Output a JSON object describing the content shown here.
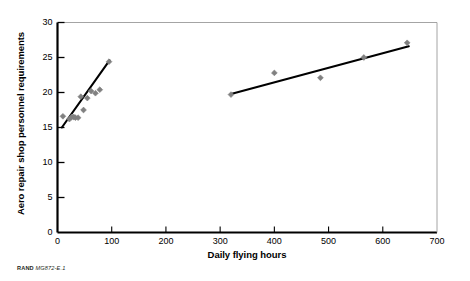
{
  "caption": {
    "organization": "RAND",
    "identifier": "MG872-E.1"
  },
  "chart_data": {
    "type": "scatter",
    "title": "",
    "subtitle": "",
    "xlabel": "Daily flying hours",
    "ylabel": "Aero repair shop personnel requirements",
    "xlim": [
      0,
      700
    ],
    "ylim": [
      0,
      30
    ],
    "xticks": [
      0,
      100,
      200,
      300,
      400,
      500,
      600,
      700
    ],
    "yticks": [
      0,
      5,
      10,
      15,
      20,
      25,
      30
    ],
    "grid": false,
    "legend": null,
    "marker_color": "#808080",
    "marker_shape": "diamond",
    "line_color": "#000000",
    "series": [
      {
        "name": "Low flying hours units",
        "points": [
          {
            "x": 10,
            "y": 16.6
          },
          {
            "x": 22,
            "y": 16.2
          },
          {
            "x": 26,
            "y": 16.5
          },
          {
            "x": 30,
            "y": 16.5
          },
          {
            "x": 33,
            "y": 16.4
          },
          {
            "x": 38,
            "y": 16.4
          },
          {
            "x": 43,
            "y": 19.4
          },
          {
            "x": 48,
            "y": 17.5
          },
          {
            "x": 55,
            "y": 19.2
          },
          {
            "x": 62,
            "y": 20.2
          },
          {
            "x": 70,
            "y": 19.9
          },
          {
            "x": 78,
            "y": 20.4
          },
          {
            "x": 95,
            "y": 24.4
          }
        ]
      },
      {
        "name": "High flying hours units",
        "points": [
          {
            "x": 320,
            "y": 19.7
          },
          {
            "x": 400,
            "y": 22.8
          },
          {
            "x": 485,
            "y": 22.1
          },
          {
            "x": 565,
            "y": 25.0
          },
          {
            "x": 645,
            "y": 27.1
          }
        ]
      }
    ],
    "trendlines": [
      {
        "name": "Low range regression",
        "x0": 8,
        "y0": 15.0,
        "x1": 96,
        "y1": 24.6
      },
      {
        "name": "High range regression",
        "x0": 320,
        "y0": 19.8,
        "x1": 648,
        "y1": 26.6
      }
    ]
  }
}
